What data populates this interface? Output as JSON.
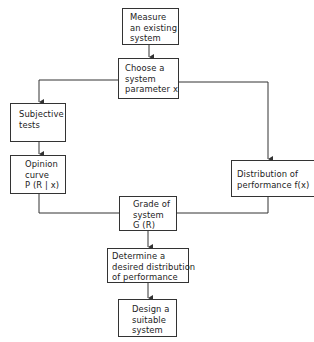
{
  "diagram": {
    "type": "flowchart",
    "nodes": [
      {
        "id": "measure",
        "lines": [
          "Measure",
          "an existing",
          "system"
        ]
      },
      {
        "id": "choose",
        "lines": [
          "Choose a",
          "system",
          "parameter x"
        ]
      },
      {
        "id": "subjective",
        "lines": [
          "Subjective",
          "tests"
        ]
      },
      {
        "id": "opinion",
        "lines": [
          "Opinion",
          "curve",
          "P (R | x)"
        ]
      },
      {
        "id": "distribution",
        "lines": [
          "Distribution of",
          "performance f(x)"
        ]
      },
      {
        "id": "grade",
        "lines": [
          "Grade of",
          "system",
          "G (R)"
        ]
      },
      {
        "id": "determine",
        "lines": [
          "Determine a",
          "desired distribution",
          "of performance"
        ]
      },
      {
        "id": "design",
        "lines": [
          "Design a",
          "suitable",
          "system"
        ]
      }
    ],
    "edges": [
      {
        "from": "measure",
        "to": "choose"
      },
      {
        "from": "choose",
        "to": "subjective"
      },
      {
        "from": "choose",
        "to": "distribution"
      },
      {
        "from": "subjective",
        "to": "opinion"
      },
      {
        "from": "opinion",
        "to": "grade"
      },
      {
        "from": "distribution",
        "to": "grade"
      },
      {
        "from": "grade",
        "to": "determine"
      },
      {
        "from": "determine",
        "to": "design"
      }
    ]
  }
}
